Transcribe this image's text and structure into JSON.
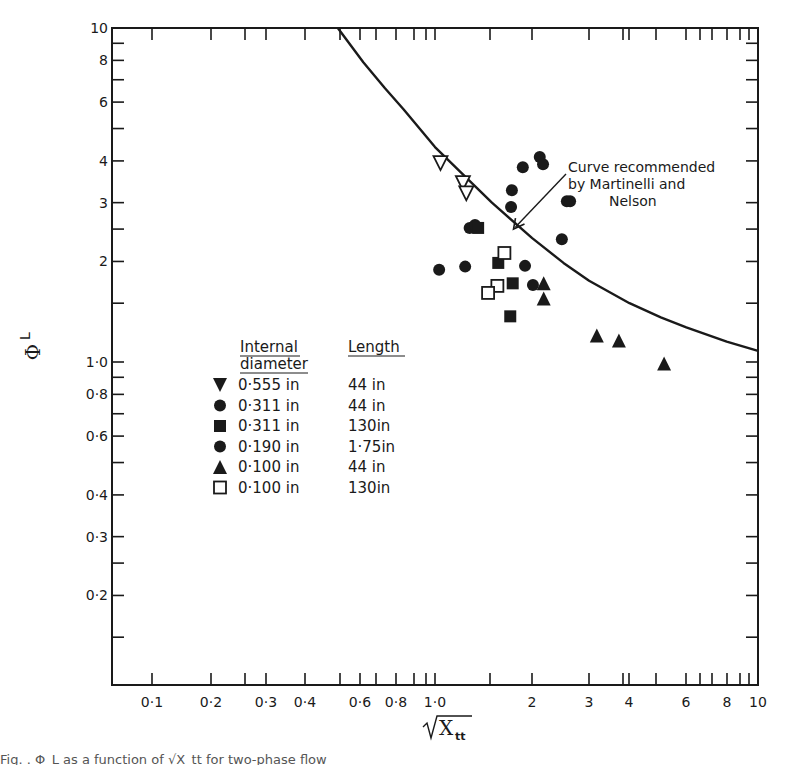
{
  "chart_data": {
    "type": "scatter",
    "title": "",
    "xlabel": "√X_tt",
    "ylabel": "Φ_L",
    "xscale": "log",
    "yscale": "log",
    "xlim": [
      0.07,
      10
    ],
    "ylim": [
      0.11,
      10
    ],
    "grid": false,
    "x_tick_labels": [
      "0·1",
      "0·2",
      "0·3",
      "0·4",
      "0·6",
      "0·8",
      "1·0",
      "2",
      "3",
      "4",
      "6",
      "8",
      "10"
    ],
    "y_tick_labels": [
      "10",
      "8",
      "6",
      "4",
      "3",
      "2",
      "1·0",
      "0·8",
      "0·6",
      "0·4",
      "0·3",
      "0·2"
    ],
    "legend": {
      "position": "center-left",
      "header_diameter": "Internal diameter",
      "header_length": "Length",
      "entries": [
        {
          "marker": "triangle-down",
          "filled": true,
          "diameter": "0·555 in",
          "length": "44 in"
        },
        {
          "marker": "circle",
          "filled": true,
          "diameter": "0·311 in",
          "length": "44 in"
        },
        {
          "marker": "square",
          "filled": true,
          "diameter": "0·311 in",
          "length": "130in"
        },
        {
          "marker": "circle",
          "filled": true,
          "diameter": "0·190 in",
          "length": "1·75in"
        },
        {
          "marker": "triangle-up",
          "filled": true,
          "diameter": "0·100 in",
          "length": "44 in"
        },
        {
          "marker": "square",
          "filled": false,
          "diameter": "0·100 in",
          "length": "130in"
        }
      ]
    },
    "annotation": {
      "lines": [
        "Curve recommended",
        "by Martinelli and",
        "Nelson"
      ],
      "arrow_to": [
        1.75,
        2.5
      ]
    },
    "curve": {
      "name": "Martinelli and Nelson",
      "x": [
        0.5,
        0.6,
        0.7,
        0.8,
        1.0,
        1.2,
        1.5,
        2.0,
        2.5,
        3.0,
        4.0,
        5.0,
        6.0,
        8.0,
        10.0
      ],
      "y": [
        10.0,
        7.9,
        6.6,
        5.7,
        4.4,
        3.7,
        3.0,
        2.35,
        1.98,
        1.75,
        1.5,
        1.36,
        1.27,
        1.15,
        1.08
      ]
    },
    "series": [
      {
        "name": "0·555 in / 44 in",
        "marker": "triangle-down-open",
        "points": [
          [
            1.04,
            3.94
          ],
          [
            1.22,
            3.43
          ],
          [
            1.25,
            3.2
          ]
        ]
      },
      {
        "name": "0·311 in / 44 in",
        "marker": "circle-filled",
        "points": [
          [
            2.11,
            4.11
          ],
          [
            2.16,
            3.91
          ],
          [
            1.87,
            3.83
          ],
          [
            1.73,
            3.27
          ],
          [
            1.72,
            2.91
          ],
          [
            2.56,
            3.03
          ],
          [
            2.62,
            3.03
          ],
          [
            2.47,
            2.33
          ],
          [
            1.28,
            2.52
          ],
          [
            1.33,
            2.57
          ]
        ]
      },
      {
        "name": "0·311 in / 130in",
        "marker": "square-filled",
        "points": [
          [
            1.36,
            2.52
          ],
          [
            1.57,
            1.98
          ],
          [
            1.74,
            1.72
          ],
          [
            1.71,
            1.37
          ]
        ]
      },
      {
        "name": "0·190 in / 1·75in",
        "marker": "circle-filled",
        "points": [
          [
            1.03,
            1.89
          ],
          [
            1.24,
            1.93
          ],
          [
            1.9,
            1.94
          ],
          [
            2.01,
            1.7
          ]
        ]
      },
      {
        "name": "0·100 in / 44 in",
        "marker": "triangle-up-filled",
        "points": [
          [
            2.17,
            1.72
          ],
          [
            2.17,
            1.55
          ],
          [
            3.17,
            1.2
          ],
          [
            3.71,
            1.16
          ],
          [
            5.12,
            0.99
          ]
        ]
      },
      {
        "name": "0·100 in / 130in",
        "marker": "square-open",
        "points": [
          [
            1.64,
            2.12
          ],
          [
            1.56,
            1.69
          ],
          [
            1.46,
            1.61
          ]
        ]
      }
    ]
  },
  "caption": "Fig. . Φ_L as a function of √X_tt for two-phase flow"
}
